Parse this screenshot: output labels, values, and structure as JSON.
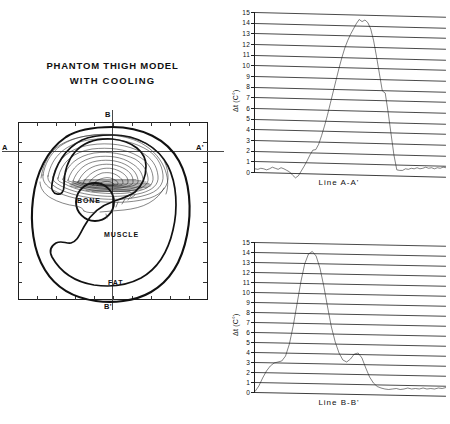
{
  "figure": {
    "background": "#ffffff",
    "ink": "#1a1a1a"
  },
  "phantom": {
    "title_line1": "PHANTOM THIGH MODEL",
    "title_line2": "WITH COOLING",
    "section_markers": {
      "a": "A",
      "a_prime": "A'",
      "b": "B",
      "b_prime": "B'"
    },
    "tissues": [
      {
        "label": "BONE"
      },
      {
        "label": "MUSCLE"
      },
      {
        "label": "FAT"
      }
    ]
  },
  "chart_data": [
    {
      "type": "line",
      "title": "",
      "caption": "Line A-A'",
      "ylabel": "Δt (C°)",
      "xlabel": "",
      "ylim": [
        0,
        15
      ],
      "yticks": [
        0,
        1,
        2,
        3,
        4,
        5,
        6,
        7,
        8,
        9,
        10,
        11,
        12,
        13,
        14,
        15
      ],
      "ytick_labels": [
        "0",
        "1",
        "2",
        "3",
        "4",
        "5",
        "6",
        "7",
        "8",
        "9",
        "10",
        "11",
        "12",
        "13",
        "14",
        "15"
      ],
      "grid": true,
      "legend": "none",
      "x": [
        0,
        2,
        4,
        6,
        8,
        10,
        12,
        14,
        16,
        18,
        20,
        22,
        24,
        26,
        28,
        30,
        32,
        34,
        36,
        38,
        40,
        42,
        44,
        46,
        48,
        50,
        52,
        54,
        56,
        58,
        60,
        62,
        64,
        66,
        68,
        70,
        72,
        74,
        76,
        78,
        80,
        82,
        84,
        86,
        88,
        90,
        92,
        94,
        96,
        98,
        100
      ],
      "values": [
        0.3,
        0.25,
        0.35,
        0.3,
        0.2,
        0.3,
        0.45,
        0.35,
        0.25,
        0.4,
        0.3,
        0.15,
        0.0,
        -0.3,
        -0.55,
        -0.35,
        0.1,
        0.55,
        1.05,
        1.6,
        2.05,
        2.1,
        2.6,
        3.4,
        4.3,
        5.3,
        6.4,
        7.5,
        8.6,
        9.7,
        10.7,
        11.6,
        12.3,
        12.9,
        13.4,
        13.9,
        14.3,
        14.1,
        14.25,
        14.0,
        13.4,
        12.3,
        10.8,
        9.2,
        7.6,
        7.4,
        5.6,
        3.6,
        1.6,
        0.2,
        0.15
      ],
      "tail": [
        0.15,
        0.3,
        0.25,
        0.35,
        0.3,
        0.4,
        0.3,
        0.35,
        0.45,
        0.35,
        0.4,
        0.3,
        0.4,
        0.35,
        0.45,
        0.4
      ]
    },
    {
      "type": "line",
      "title": "",
      "caption": "Line B-B'",
      "ylabel": "Δt (C°)",
      "xlabel": "",
      "ylim": [
        0,
        15
      ],
      "yticks": [
        0,
        1,
        2,
        3,
        4,
        5,
        6,
        7,
        8,
        9,
        10,
        11,
        12,
        13,
        14,
        15
      ],
      "ytick_labels": [
        "0",
        "1",
        "2",
        "3",
        "4",
        "5",
        "6",
        "7",
        "8",
        "9",
        "10",
        "11",
        "12",
        "13",
        "14",
        "15"
      ],
      "grid": true,
      "legend": "none",
      "x": [
        0,
        2,
        4,
        6,
        8,
        10,
        12,
        14,
        16,
        18,
        20,
        22,
        24,
        26,
        28,
        30,
        32,
        34,
        36,
        38,
        40,
        42,
        44,
        46,
        48,
        50,
        52,
        54,
        56,
        58,
        60,
        62,
        64,
        66,
        68,
        70,
        72,
        74,
        76,
        78,
        80,
        82,
        84,
        86,
        88,
        90,
        92,
        94,
        96,
        98,
        100
      ],
      "values": [
        0.05,
        0.6,
        1.4,
        2.1,
        2.6,
        2.9,
        3.0,
        3.1,
        3.6,
        4.8,
        6.6,
        8.8,
        11.0,
        12.8,
        13.8,
        14.05,
        13.6,
        12.4,
        10.6,
        8.5,
        6.5,
        5.0,
        3.9,
        3.2,
        3.0,
        3.3,
        3.8,
        3.9,
        3.4,
        2.4,
        1.5,
        0.9,
        0.55,
        0.4,
        0.3,
        0.25,
        0.3,
        0.35,
        0.25,
        0.3,
        0.4,
        0.3,
        0.35,
        0.3,
        0.4,
        0.3,
        0.35,
        0.3,
        0.4,
        0.35,
        0.45
      ],
      "peaks": [
        {
          "name": "primary",
          "value": 14.05
        },
        {
          "name": "secondary",
          "value": 3.9
        }
      ]
    }
  ]
}
